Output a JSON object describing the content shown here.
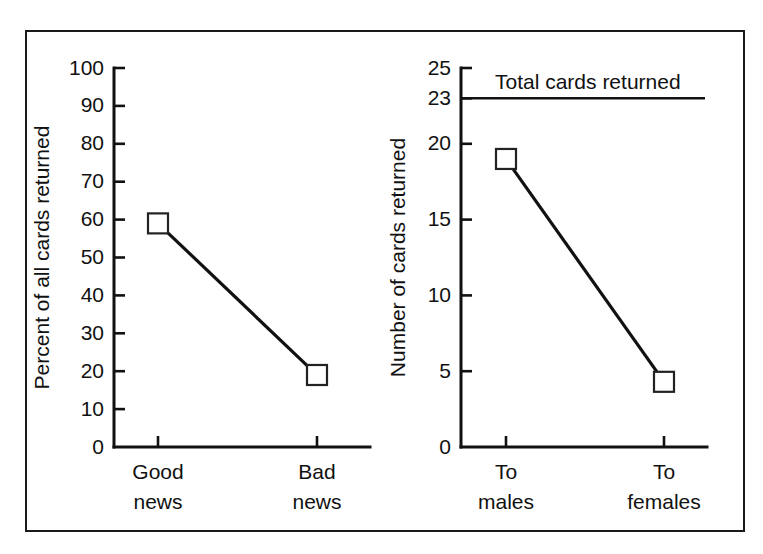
{
  "figure": {
    "frame": {
      "border_color": "#1a1a1a",
      "background": "#ffffff"
    },
    "ink_color": "#111111",
    "marker_fill": "#ffffff"
  },
  "chart_data": [
    {
      "type": "line",
      "panel": "left",
      "title": "",
      "xlabel": "",
      "ylabel": "Percent of all cards returned",
      "categories": [
        "Good news",
        "Bad news"
      ],
      "category_lines": [
        [
          "Good",
          "news"
        ],
        [
          "Bad",
          "news"
        ]
      ],
      "values": [
        59,
        19
      ],
      "ylim": [
        0,
        100
      ],
      "yticks": [
        0,
        10,
        20,
        30,
        40,
        50,
        60,
        70,
        80,
        90,
        100
      ],
      "ytick_labels": [
        "0",
        "10",
        "20",
        "30",
        "40",
        "50",
        "60",
        "70",
        "80",
        "90",
        "100"
      ],
      "grid": false,
      "legend": "none",
      "marker": "open-square",
      "annotations": []
    },
    {
      "type": "line",
      "panel": "right",
      "title": "",
      "xlabel": "",
      "ylabel": "Number of cards returned",
      "categories": [
        "To males",
        "To females"
      ],
      "category_lines": [
        [
          "To",
          "males"
        ],
        [
          "To",
          "females"
        ]
      ],
      "values": [
        19,
        4.3
      ],
      "ylim": [
        0,
        25
      ],
      "yticks": [
        0,
        5,
        10,
        15,
        20,
        23,
        25
      ],
      "ytick_labels": [
        "0",
        "5",
        "10",
        "15",
        "20",
        "23",
        "25"
      ],
      "grid": false,
      "legend": "none",
      "marker": "open-square",
      "reference_lines": [
        {
          "label": "Total cards returned",
          "value": 23
        }
      ],
      "annotations": [
        "Total cards returned"
      ]
    }
  ]
}
